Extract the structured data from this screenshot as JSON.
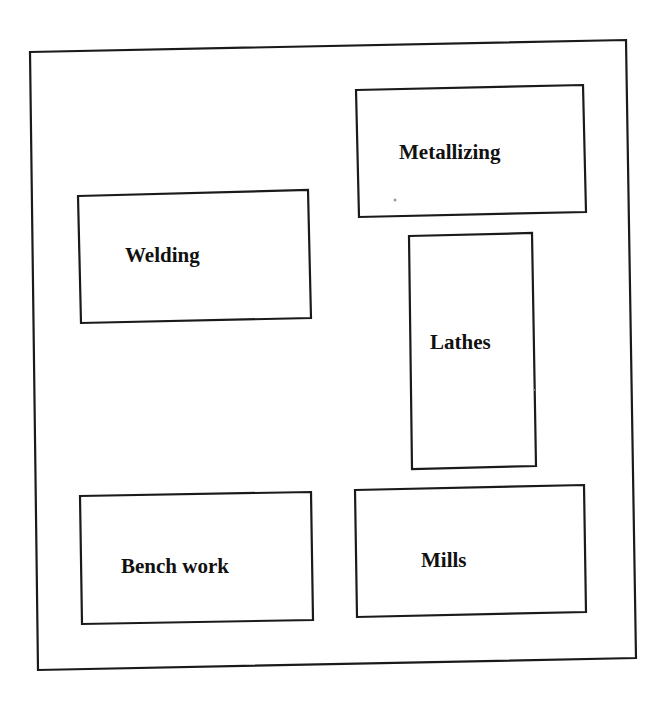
{
  "diagram": {
    "type": "facility-layout",
    "departments": [
      {
        "id": "metallizing",
        "label": "Metallizing"
      },
      {
        "id": "welding",
        "label": "Welding"
      },
      {
        "id": "lathes",
        "label": "Lathes"
      },
      {
        "id": "bench-work",
        "label": "Bench work"
      },
      {
        "id": "mills",
        "label": "Mills"
      }
    ],
    "colors": {
      "stroke": "#1a1a1a",
      "text": "#111111",
      "background": "#ffffff"
    }
  }
}
